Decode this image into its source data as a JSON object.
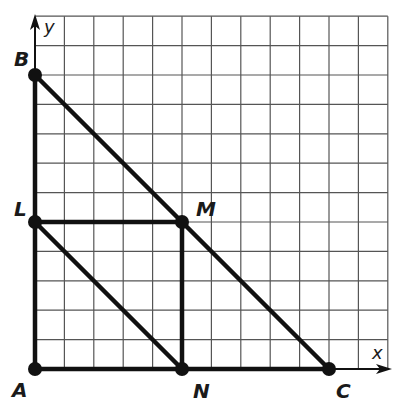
{
  "diagram": {
    "type": "coordinate-geometry",
    "grid": {
      "cells_x": 12,
      "cells_y": 12,
      "unit": 1
    },
    "axes": {
      "x_label": "x",
      "y_label": "y"
    },
    "points": [
      {
        "name": "A",
        "x": 0,
        "y": 0
      },
      {
        "name": "B",
        "x": 0,
        "y": 10
      },
      {
        "name": "C",
        "x": 10,
        "y": 0
      },
      {
        "name": "L",
        "x": 0,
        "y": 5
      },
      {
        "name": "M",
        "x": 5,
        "y": 5
      },
      {
        "name": "N",
        "x": 5,
        "y": 0
      }
    ],
    "segments": [
      [
        "A",
        "B"
      ],
      [
        "A",
        "C"
      ],
      [
        "B",
        "C"
      ],
      [
        "L",
        "M"
      ],
      [
        "M",
        "N"
      ],
      [
        "L",
        "N"
      ]
    ],
    "colors": {
      "line": "#111111",
      "grid": "#555555",
      "background": "#ffffff"
    }
  },
  "labels": {
    "A": "A",
    "B": "B",
    "C": "C",
    "L": "L",
    "M": "M",
    "N": "N",
    "x_axis": "x",
    "y_axis": "y"
  }
}
